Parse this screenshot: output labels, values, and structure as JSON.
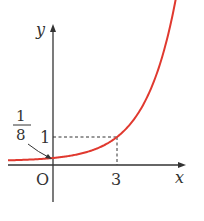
{
  "chart_data": {
    "type": "line",
    "title": "",
    "function": "y = 2^x / 8",
    "xlabel": "x",
    "ylabel": "y",
    "origin_label": "O",
    "x_ticks": [
      {
        "value": 3,
        "label": "3"
      }
    ],
    "y_ticks": [
      {
        "value": 1,
        "label": "1"
      }
    ],
    "annotations": [
      {
        "label": "1/8",
        "numerator": "1",
        "denominator": "8",
        "points_to": [
          0,
          0.125
        ]
      }
    ],
    "dashed_guides": [
      {
        "x": 3,
        "y": 1
      }
    ],
    "series": [
      {
        "name": "curve",
        "color": "#e0392f",
        "x": [
          -1.5,
          -1,
          0,
          1,
          2,
          3,
          4,
          4.9
        ],
        "y": [
          0.044,
          0.0625,
          0.125,
          0.25,
          0.5,
          1,
          2,
          3.73
        ]
      }
    ],
    "grid": false,
    "legend": null
  },
  "colors": {
    "curve": "#e0392f",
    "axis": "#333333"
  }
}
